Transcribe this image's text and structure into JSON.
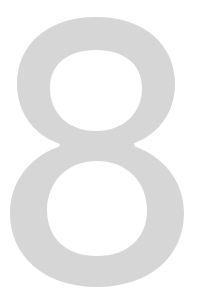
{
  "glyph": {
    "character": "8",
    "color": "#d8d8d8",
    "background": "#ffffff"
  }
}
